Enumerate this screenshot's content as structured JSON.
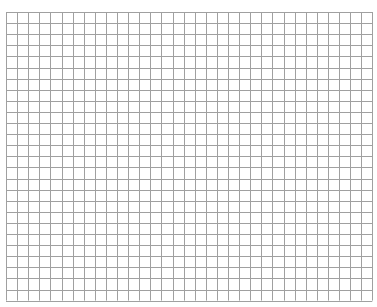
{
  "grid": {
    "left": 6,
    "top": 12,
    "cell_size": 11.1,
    "columns": 33,
    "rows": 26,
    "line_color": "#a0a0a0",
    "background": "#ffffff"
  }
}
